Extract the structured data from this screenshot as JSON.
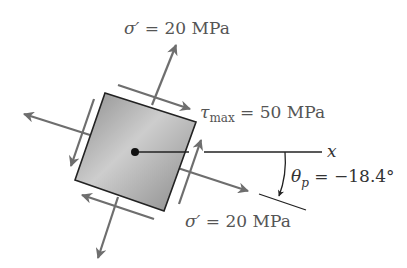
{
  "diagram": {
    "type": "stress-element",
    "labels": {
      "normal_top": {
        "symbol": "σ′",
        "eq": " = ",
        "value": "20 MPa"
      },
      "shear": {
        "symbol": "τ",
        "subscript": "max",
        "eq": " = ",
        "value": "50 MPa"
      },
      "axis_x": "x",
      "angle": {
        "symbol": "θ",
        "subscript": "p",
        "eq": " = ",
        "value": "−18.4°"
      },
      "normal_bottom": {
        "symbol": "σ′",
        "eq": " = ",
        "value": "20 MPa"
      }
    },
    "colors": {
      "arrow": "#6e6e6e",
      "square_fill_light": "#c8c8c8",
      "square_fill_dark": "#8a8a8a",
      "square_edge": "#222222",
      "axis_line": "#222222",
      "text": "#555555"
    }
  }
}
